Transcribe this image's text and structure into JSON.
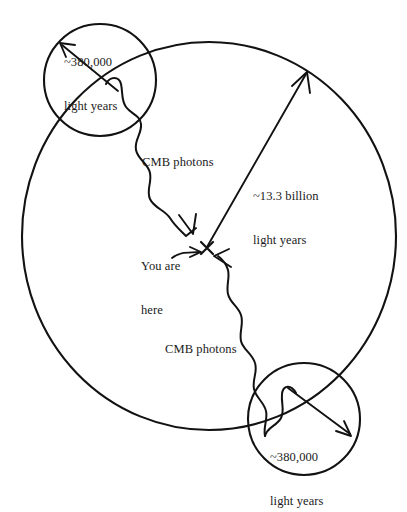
{
  "figure": {
    "type": "cosmology-diagram",
    "background_color": "#ffffff",
    "ink_color": "#121212"
  },
  "labels": {
    "top_circle": {
      "line1": "~380,000",
      "line2": "light years"
    },
    "bottom_circle": {
      "line1": "~380,000",
      "line2": "light years"
    },
    "radius": {
      "line1": "~13.3 billion",
      "line2": "light years"
    },
    "cmb_upper": "CMB photons",
    "cmb_lower": "CMB photons",
    "observer": {
      "line1": "You are",
      "line2": "here"
    }
  },
  "shapes": {
    "observable_universe_circle": {
      "name": "observable-universe-boundary",
      "center_x": 209,
      "center_y": 236,
      "radius_x": 187,
      "radius_y": 194
    },
    "top_last_scattering_circle": {
      "name": "last-scattering-surface-top",
      "center_x": 100,
      "center_y": 80,
      "radius": 56
    },
    "bottom_last_scattering_circle": {
      "name": "last-scattering-surface-bottom",
      "center_x": 304,
      "center_y": 419,
      "radius": 56
    },
    "observer_mark": {
      "name": "you-are-here-x",
      "x": 207,
      "y": 248
    }
  },
  "arrows": {
    "radius_arrow": {
      "name": "radius-arrow",
      "from_x": 207,
      "from_y": 247,
      "to_x": 306,
      "to_y": 74
    },
    "top_circle_arrow": {
      "name": "top-circle-radius-arrow",
      "from_x": 118,
      "from_y": 91,
      "to_x": 60,
      "to_y": 43
    },
    "bottom_circle_arrow": {
      "name": "bottom-circle-radius-arrow",
      "from_x": 288,
      "from_y": 388,
      "to_x": 350,
      "to_y": 434
    },
    "observer_pointer": {
      "name": "you-are-here-pointer",
      "from_x": 173,
      "from_y": 255,
      "to_x": 201,
      "to_y": 252
    }
  }
}
